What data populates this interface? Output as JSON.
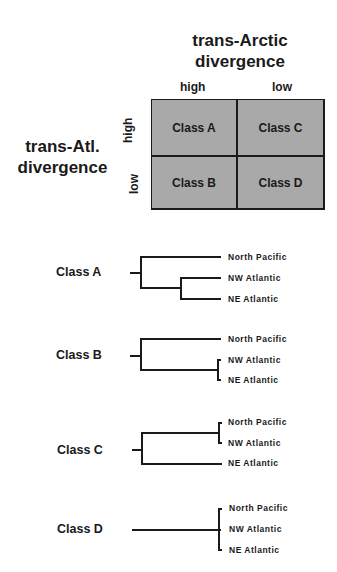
{
  "matrix": {
    "column_title_line1": "trans-Arctic",
    "column_title_line2": "divergence",
    "row_title_line1": "trans-Atl.",
    "row_title_line2": "divergence",
    "column_labels": [
      "high",
      "low"
    ],
    "row_labels": [
      "high",
      "low"
    ],
    "cells": [
      [
        "Class A",
        "Class C"
      ],
      [
        "Class B",
        "Class D"
      ]
    ],
    "cell_color": "#a9a9a9"
  },
  "trees": [
    {
      "label": "Class A",
      "leaves": [
        "North Pacific",
        "NW Atlantic",
        "NE Atlantic"
      ],
      "topology": "(NP,(NW,NE))"
    },
    {
      "label": "Class B",
      "leaves": [
        "North Pacific",
        "NW Atlantic",
        "NE Atlantic"
      ],
      "topology": "(NP,(NW,NE)) shallow"
    },
    {
      "label": "Class C",
      "leaves": [
        "North Pacific",
        "NW Atlantic",
        "NE Atlantic"
      ],
      "topology": "((NP,NW) shallow,NE)"
    },
    {
      "label": "Class D",
      "leaves": [
        "North Pacific",
        "NW Atlantic",
        "NE Atlantic"
      ],
      "topology": "polytomy"
    }
  ]
}
